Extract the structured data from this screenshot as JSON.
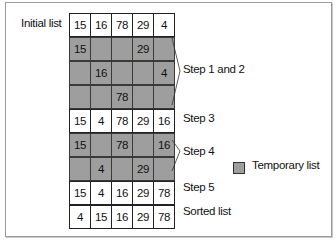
{
  "diagram": {
    "type": "merge-sort-steps",
    "left_label": "Initial list",
    "rows": [
      {
        "id": "initial",
        "temporary": false,
        "cells": [
          "15",
          "16",
          "78",
          "29",
          "4"
        ]
      },
      {
        "id": "s12a",
        "temporary": true,
        "cells": [
          "15",
          "",
          "",
          "29",
          ""
        ]
      },
      {
        "id": "s12b",
        "temporary": true,
        "cells": [
          "",
          "16",
          "",
          "",
          "4"
        ]
      },
      {
        "id": "s12c",
        "temporary": true,
        "cells": [
          "",
          "",
          "78",
          "",
          ""
        ]
      },
      {
        "id": "step3",
        "temporary": false,
        "cells": [
          "15",
          "4",
          "78",
          "29",
          "16"
        ]
      },
      {
        "id": "s4a",
        "temporary": true,
        "cells": [
          "15",
          "",
          "78",
          "",
          "16"
        ]
      },
      {
        "id": "s4b",
        "temporary": true,
        "cells": [
          "",
          "4",
          "",
          "29",
          ""
        ]
      },
      {
        "id": "step5",
        "temporary": false,
        "cells": [
          "15",
          "4",
          "16",
          "29",
          "78"
        ]
      },
      {
        "id": "sorted",
        "temporary": false,
        "cells": [
          "4",
          "15",
          "16",
          "29",
          "78"
        ]
      }
    ],
    "step_labels": {
      "step12": "Step 1 and 2",
      "step3": "Step 3",
      "step4": "Step 4",
      "step5": "Step 5",
      "sorted": "Sorted list"
    },
    "legend": {
      "label": "Temporary list",
      "color": "#9e9e9e"
    }
  }
}
